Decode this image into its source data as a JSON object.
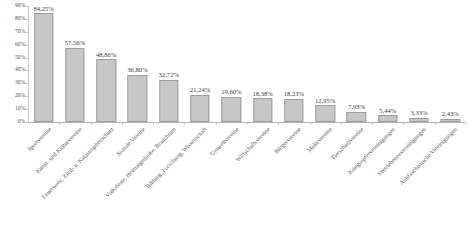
{
  "chart_data": {
    "type": "bar",
    "title": "",
    "subtitle": "",
    "xlabel": "",
    "ylabel": "",
    "ylim": [
      0,
      90
    ],
    "ytick_labels": [
      "90%",
      "80%",
      "70%",
      "60%",
      "50%",
      "40%",
      "30%",
      "20%",
      "10%",
      "0%"
    ],
    "ytick_values": [
      90,
      80,
      70,
      60,
      50,
      40,
      30,
      20,
      10,
      0
    ],
    "grid": false,
    "legend": null,
    "value_label_suffix": "%",
    "bar_color": "#c7c7c7",
    "bar_border_color": "#9e9e9e",
    "axis_color": "#c9c9c9",
    "text_color": "#555555",
    "categories": [
      "Sportvereine",
      "Kunst- und Kulturvereine",
      "Feuerwehr, Zivil- u. Katastrophenschutz",
      "Soziale Vereine",
      "Volksfeste, Heimatgedanke, Brauchtum",
      "Bildung, Forschung, Wissenschaft",
      "Umweltvereine",
      "Wirtschaftsvereine",
      "Bürgervereine",
      "Mulärvereine",
      "Tierschutzvereine",
      "Kriegsopfervereinigungen",
      "Vertriebenenvereinigungen",
      "Antifaschistische Vereinigungen"
    ],
    "values": [
      84.25,
      57.56,
      48.86,
      36.8,
      32.72,
      21.24,
      19.6,
      18.38,
      18.23,
      12.95,
      7.93,
      5.44,
      3.33,
      2.43
    ],
    "value_labels": [
      "84,25%",
      "57,56%",
      "48,86%",
      "36,80%",
      "32,72%",
      "21,24%",
      "19,60%",
      "18,38%",
      "18,23%",
      "12,95%",
      "7,93%",
      "5,44%",
      "3,33%",
      "2,43%"
    ]
  }
}
